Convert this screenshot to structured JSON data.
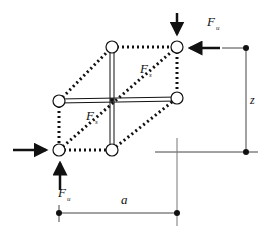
{
  "diagram": {
    "labels": {
      "force_top": "F",
      "force_top_sub": "u",
      "force_bottom": "F",
      "force_bottom_sub": "u",
      "force_strut_upper": "F",
      "force_strut_upper_sub": "s",
      "force_strut_lower": "F",
      "force_strut_lower_sub": "s",
      "dim_horizontal": "a",
      "dim_vertical": "z"
    },
    "nodes": [
      {
        "id": "top-left",
        "x": 112,
        "y": 47
      },
      {
        "id": "top-right",
        "x": 177,
        "y": 47
      },
      {
        "id": "mid-left",
        "x": 59,
        "y": 101
      },
      {
        "id": "mid-right",
        "x": 177,
        "y": 98
      },
      {
        "id": "bottom-left",
        "x": 59,
        "y": 150
      },
      {
        "id": "bottom-mid",
        "x": 112,
        "y": 150
      }
    ],
    "colors": {
      "line": "#111111",
      "node_fill": "#ffffff",
      "dim_line": "#444444"
    }
  }
}
